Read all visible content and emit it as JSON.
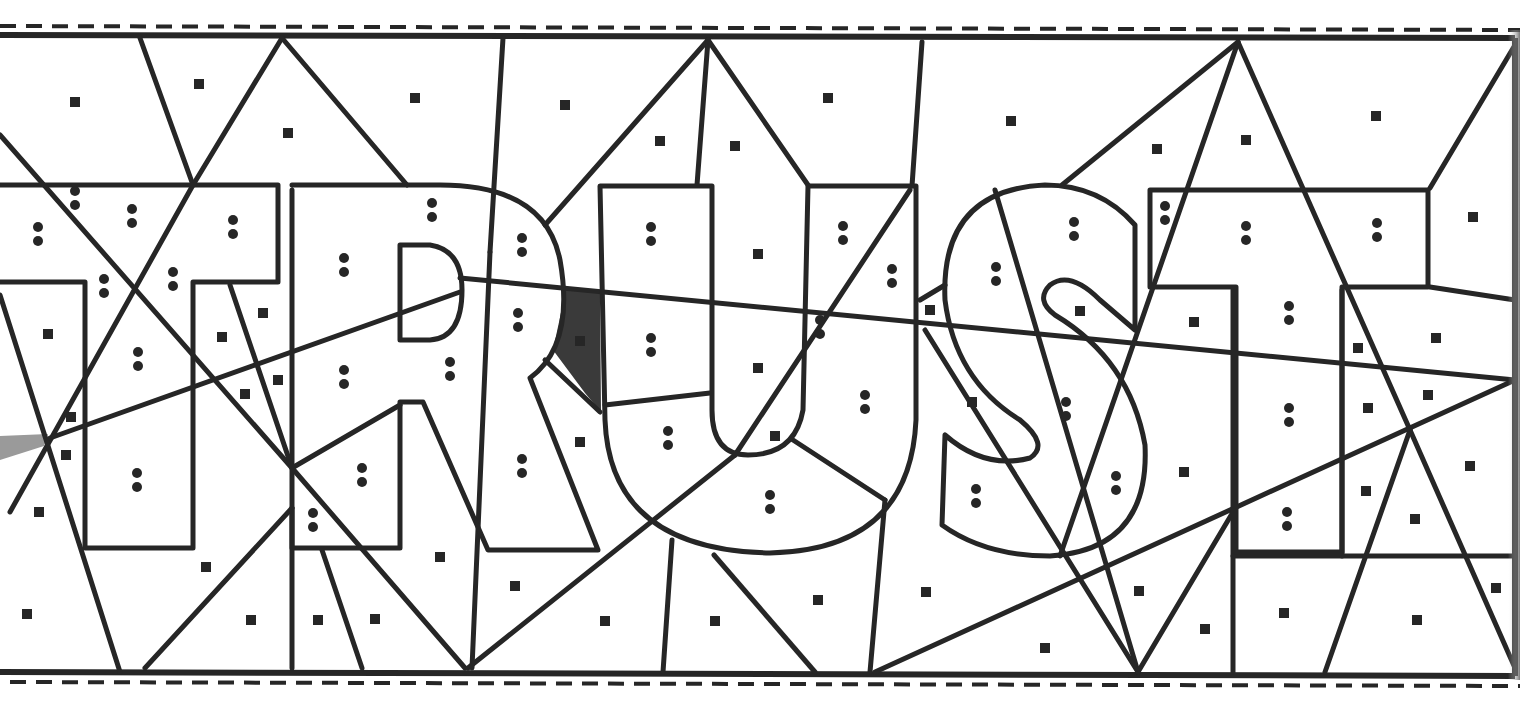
{
  "worksheet": {
    "type": "color-by-symbol puzzle",
    "hidden_word": "TRUST",
    "letters": [
      "T",
      "R",
      "U",
      "S",
      "T"
    ],
    "legend": {
      "square_symbol": "■",
      "double_dot_symbol": ":"
    },
    "colors": {
      "line": "#262626",
      "paper": "#ffffff",
      "shaded_region": "#3a3a3a",
      "gray_marker": "#9a9a9a"
    },
    "squares": [
      [
        75,
        102
      ],
      [
        199,
        84
      ],
      [
        288,
        133
      ],
      [
        415,
        98
      ],
      [
        565,
        105
      ],
      [
        660,
        141
      ],
      [
        735,
        146
      ],
      [
        828,
        98
      ],
      [
        1011,
        121
      ],
      [
        1157,
        149
      ],
      [
        1246,
        140
      ],
      [
        1376,
        116
      ],
      [
        1473,
        217
      ],
      [
        48,
        334
      ],
      [
        263,
        313
      ],
      [
        222,
        337
      ],
      [
        278,
        380
      ],
      [
        245,
        394
      ],
      [
        71,
        417
      ],
      [
        66,
        455
      ],
      [
        39,
        512
      ],
      [
        758,
        254
      ],
      [
        758,
        368
      ],
      [
        580,
        442
      ],
      [
        775,
        436
      ],
      [
        930,
        310
      ],
      [
        972,
        402
      ],
      [
        1080,
        311
      ],
      [
        1194,
        322
      ],
      [
        1436,
        338
      ],
      [
        1358,
        348
      ],
      [
        1428,
        395
      ],
      [
        1368,
        408
      ],
      [
        1184,
        472
      ],
      [
        1366,
        491
      ],
      [
        1470,
        466
      ],
      [
        1415,
        519
      ],
      [
        206,
        567
      ],
      [
        440,
        557
      ],
      [
        515,
        586
      ],
      [
        27,
        614
      ],
      [
        251,
        620
      ],
      [
        318,
        620
      ],
      [
        375,
        619
      ],
      [
        605,
        621
      ],
      [
        715,
        621
      ],
      [
        818,
        600
      ],
      [
        926,
        592
      ],
      [
        1045,
        648
      ],
      [
        1139,
        591
      ],
      [
        1205,
        629
      ],
      [
        1284,
        613
      ],
      [
        1417,
        620
      ],
      [
        1496,
        588
      ],
      [
        1496,
        588
      ],
      [
        580,
        341
      ]
    ],
    "dots": [
      [
        75,
        198
      ],
      [
        38,
        234
      ],
      [
        132,
        216
      ],
      [
        233,
        227
      ],
      [
        104,
        286
      ],
      [
        173,
        279
      ],
      [
        344,
        265
      ],
      [
        432,
        210
      ],
      [
        522,
        245
      ],
      [
        518,
        320
      ],
      [
        651,
        234
      ],
      [
        651,
        345
      ],
      [
        843,
        233
      ],
      [
        892,
        276
      ],
      [
        820,
        327
      ],
      [
        138,
        359
      ],
      [
        344,
        377
      ],
      [
        450,
        369
      ],
      [
        865,
        402
      ],
      [
        668,
        438
      ],
      [
        137,
        480
      ],
      [
        362,
        475
      ],
      [
        313,
        520
      ],
      [
        522,
        466
      ],
      [
        770,
        502
      ],
      [
        996,
        274
      ],
      [
        1074,
        229
      ],
      [
        1066,
        409
      ],
      [
        1116,
        483
      ],
      [
        976,
        496
      ],
      [
        1165,
        213
      ],
      [
        1246,
        233
      ],
      [
        1377,
        230
      ],
      [
        1289,
        313
      ],
      [
        1289,
        415
      ],
      [
        1287,
        519
      ]
    ]
  }
}
